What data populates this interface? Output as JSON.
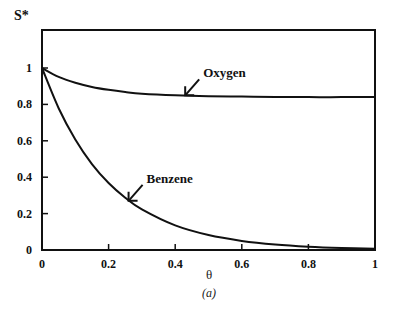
{
  "chart_data": {
    "type": "line",
    "title": "",
    "xlabel": "θ",
    "ylabel": "S*",
    "caption": "(a)",
    "xlim": [
      0,
      1
    ],
    "ylim": [
      0,
      1.2
    ],
    "grid": false,
    "xticks": [
      "0",
      "0.2",
      "0.4",
      "0.6",
      "0.8",
      "1"
    ],
    "yticks": [
      "0",
      "0.2",
      "0.4",
      "0.6",
      "0.8",
      "1"
    ],
    "x": [
      0,
      0.05,
      0.1,
      0.15,
      0.2,
      0.25,
      0.3,
      0.4,
      0.5,
      0.6,
      0.7,
      0.8,
      0.9,
      1.0
    ],
    "series": [
      {
        "name": "Oxygen",
        "values": [
          1.0,
          0.951,
          0.919,
          0.896,
          0.88,
          0.868,
          0.859,
          0.85,
          0.845,
          0.843,
          0.841,
          0.84,
          0.84,
          0.84
        ]
      },
      {
        "name": "Benzene",
        "values": [
          1.0,
          0.779,
          0.607,
          0.472,
          0.368,
          0.287,
          0.223,
          0.135,
          0.082,
          0.05,
          0.03,
          0.018,
          0.011,
          0.007
        ]
      }
    ],
    "annotations": [
      {
        "text": "Oxygen",
        "arrow_to": [
          0.43,
          0.85
        ]
      },
      {
        "text": "Benzene",
        "arrow_to": [
          0.26,
          0.27
        ]
      }
    ]
  }
}
